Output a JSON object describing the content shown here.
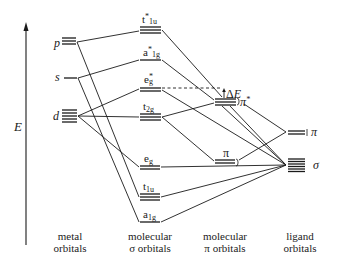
{
  "diagram": {
    "type": "molecular-orbital-energy-diagram",
    "axis": {
      "label": "E",
      "direction": "up"
    },
    "columns": [
      {
        "id": "metal",
        "line1": "metal",
        "line2": "orbitals"
      },
      {
        "id": "sigma",
        "line1": "molecular",
        "line2": "σ orbitals"
      },
      {
        "id": "pi",
        "line1": "molecular",
        "line2": "π orbitals"
      },
      {
        "id": "ligand",
        "line1": "ligand",
        "line2": "orbitals"
      }
    ],
    "metal_orbitals": [
      {
        "label": "p",
        "degeneracy": 3
      },
      {
        "label": "s",
        "degeneracy": 1
      },
      {
        "label": "d",
        "degeneracy": 5
      }
    ],
    "sigma_orbitals": [
      {
        "base": "t",
        "sub": "1u",
        "star": true,
        "degeneracy": 3
      },
      {
        "base": "a",
        "sub": "1g",
        "star": true,
        "degeneracy": 1
      },
      {
        "base": "e",
        "sub": "g",
        "star": true,
        "degeneracy": 2
      },
      {
        "base": "t",
        "sub": "2g",
        "star": false,
        "degeneracy": 3
      },
      {
        "base": "e",
        "sub": "g",
        "star": false,
        "degeneracy": 2
      },
      {
        "base": "t",
        "sub": "1u",
        "star": false,
        "degeneracy": 3
      },
      {
        "base": "a",
        "sub": "1g",
        "star": false,
        "degeneracy": 1
      }
    ],
    "pi_orbitals": [
      {
        "label": "π*",
        "degeneracy": 3
      },
      {
        "label": "π",
        "degeneracy": 3
      }
    ],
    "ligand_orbitals": [
      {
        "label": "π",
        "degeneracy": 2
      },
      {
        "label": "σ",
        "degeneracy": 6
      }
    ],
    "annotations": {
      "delta_e": "ΔE",
      "pi_star": "π*",
      "pi_bonding": "π"
    }
  },
  "labels": {
    "E": "E",
    "p": "p",
    "s": "s",
    "d": "d",
    "t": "t",
    "a": "a",
    "e": "e",
    "sub_1u": "1u",
    "sub_1g": "1g",
    "sub_g": "g",
    "sub_2g": "2g",
    "star": "*",
    "delta": "Δ",
    "E_var": "E",
    "pi": "π",
    "pi_star_sym": "*",
    "sigma": "σ",
    "ligand_pi": "π",
    "ligand_sigma": "σ",
    "col_metal_1": "metal",
    "col_metal_2": "orbitals",
    "col_sigma_1": "molecular",
    "col_sigma_2": "σ orbitals",
    "col_pi_1": "molecular",
    "col_pi_2": "π orbitals",
    "col_ligand_1": "ligand",
    "col_ligand_2": "orbitals"
  }
}
